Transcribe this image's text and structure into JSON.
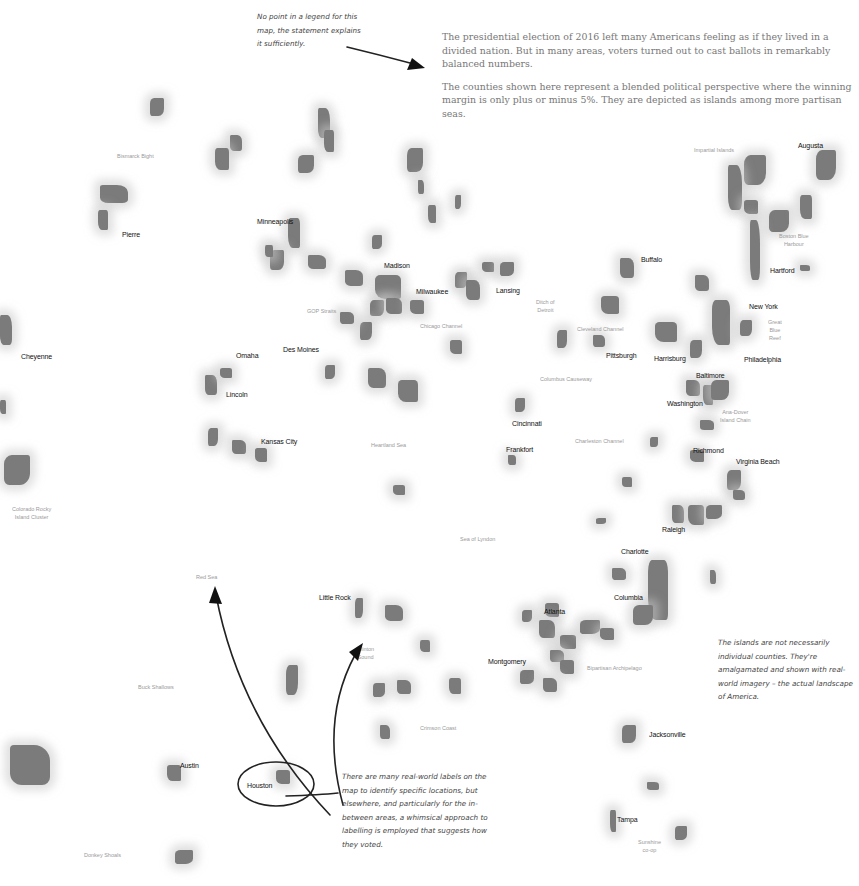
{
  "intro": {
    "paragraph1": "The presidential election of 2016 left many Americans feeling as if they lived in a divided nation. But in many areas, voters turned out to cast ballots in remarkably balanced numbers.",
    "paragraph2": "The counties shown here represent a blended political perspective where the winning margin is only plus or minus 5%. They are depicted as islands among more partisan seas."
  },
  "notes": {
    "legend_note": "No point in a legend for this map, the statement explains it sufficiently.",
    "islands_note": "The islands are not necessarily individual counties. They're amalgamated and shown with real-world imagery – the actual landscape of America.",
    "labels_note": "There are many real-world labels on the map to identify specific locations, but elsewhere, and particularly for the in-between areas, a whimsical approach to labelling is employed that suggests how they voted."
  },
  "cities": [
    {
      "name": "Augusta",
      "x": 798,
      "y": 142
    },
    {
      "name": "Pierre",
      "x": 122,
      "y": 231
    },
    {
      "name": "Minneapolis",
      "x": 257,
      "y": 218
    },
    {
      "name": "Madison",
      "x": 384,
      "y": 262
    },
    {
      "name": "Milwaukee",
      "x": 416,
      "y": 288
    },
    {
      "name": "Lansing",
      "x": 496,
      "y": 287
    },
    {
      "name": "Buffalo",
      "x": 641,
      "y": 256
    },
    {
      "name": "Hartford",
      "x": 770,
      "y": 267
    },
    {
      "name": "New York",
      "x": 749,
      "y": 303
    },
    {
      "name": "Cheyenne",
      "x": 21,
      "y": 353
    },
    {
      "name": "Omaha",
      "x": 236,
      "y": 352
    },
    {
      "name": "Des Moines",
      "x": 283,
      "y": 346
    },
    {
      "name": "Lincoln",
      "x": 226,
      "y": 391
    },
    {
      "name": "Pittsburgh",
      "x": 606,
      "y": 352
    },
    {
      "name": "Harrisburg",
      "x": 654,
      "y": 355
    },
    {
      "name": "Philadelphia",
      "x": 744,
      "y": 356
    },
    {
      "name": "Baltimore",
      "x": 696,
      "y": 372
    },
    {
      "name": "Washington",
      "x": 667,
      "y": 400
    },
    {
      "name": "Cincinnati",
      "x": 512,
      "y": 420
    },
    {
      "name": "Kansas City",
      "x": 261,
      "y": 438
    },
    {
      "name": "Frankfort",
      "x": 506,
      "y": 446
    },
    {
      "name": "Richmond",
      "x": 693,
      "y": 447
    },
    {
      "name": "Virginia Beach",
      "x": 736,
      "y": 458
    },
    {
      "name": "Raleigh",
      "x": 662,
      "y": 526
    },
    {
      "name": "Charlotte",
      "x": 621,
      "y": 548
    },
    {
      "name": "Little Rock",
      "x": 319,
      "y": 594
    },
    {
      "name": "Columbia",
      "x": 614,
      "y": 594
    },
    {
      "name": "Atlanta",
      "x": 544,
      "y": 608
    },
    {
      "name": "Montgomery",
      "x": 488,
      "y": 658
    },
    {
      "name": "Jacksonville",
      "x": 649,
      "y": 731
    },
    {
      "name": "Austin",
      "x": 180,
      "y": 762
    },
    {
      "name": "Houston",
      "x": 247,
      "y": 782
    },
    {
      "name": "Tampa",
      "x": 617,
      "y": 816
    }
  ],
  "seas": [
    {
      "name": "Bismarck Bight",
      "x": 117,
      "y": 152
    },
    {
      "name": "Impartial Islands",
      "x": 694,
      "y": 146
    },
    {
      "name": "Boston Blue\nHarbour",
      "x": 779,
      "y": 232
    },
    {
      "name": "GOP Straits",
      "x": 307,
      "y": 307
    },
    {
      "name": "Chicago Channel",
      "x": 420,
      "y": 322
    },
    {
      "name": "Ditch of\nDetroit",
      "x": 536,
      "y": 298
    },
    {
      "name": "Cleveland Channel",
      "x": 577,
      "y": 325
    },
    {
      "name": "Great\nBlue\nReef",
      "x": 768,
      "y": 318
    },
    {
      "name": "Columbus Causeway",
      "x": 540,
      "y": 375
    },
    {
      "name": "Ana-Dover\nIsland Chain",
      "x": 720,
      "y": 408
    },
    {
      "name": "Heartland Sea",
      "x": 371,
      "y": 441
    },
    {
      "name": "Charleston Channel",
      "x": 575,
      "y": 437
    },
    {
      "name": "Colorado Rocky\nIsland Cluster",
      "x": 12,
      "y": 505
    },
    {
      "name": "Sea of Lyndon",
      "x": 460,
      "y": 535
    },
    {
      "name": "Red Sea",
      "x": 196,
      "y": 573
    },
    {
      "name": "Clinton\nSound",
      "x": 357,
      "y": 645
    },
    {
      "name": "Bipartisan Archipelago",
      "x": 587,
      "y": 664
    },
    {
      "name": "Buck Shallows",
      "x": 138,
      "y": 683
    },
    {
      "name": "Crimson Coast",
      "x": 420,
      "y": 724
    },
    {
      "name": "Donkey Shoals",
      "x": 84,
      "y": 851
    },
    {
      "name": "Sunshine\nco-op",
      "x": 638,
      "y": 838
    }
  ],
  "islands": [
    [
      150,
      98,
      14,
      18
    ],
    [
      230,
      135,
      12,
      16
    ],
    [
      215,
      148,
      14,
      22
    ],
    [
      298,
      155,
      16,
      18
    ],
    [
      318,
      108,
      12,
      30
    ],
    [
      324,
      130,
      10,
      22
    ],
    [
      407,
      148,
      16,
      24
    ],
    [
      418,
      180,
      6,
      14
    ],
    [
      428,
      205,
      8,
      18
    ],
    [
      455,
      195,
      6,
      14
    ],
    [
      100,
      185,
      28,
      18
    ],
    [
      98,
      210,
      10,
      20
    ],
    [
      744,
      155,
      22,
      30
    ],
    [
      728,
      165,
      14,
      45
    ],
    [
      744,
      200,
      14,
      14
    ],
    [
      769,
      210,
      20,
      22
    ],
    [
      750,
      220,
      10,
      60
    ],
    [
      800,
      195,
      12,
      24
    ],
    [
      816,
      150,
      20,
      30
    ],
    [
      800,
      265,
      10,
      6
    ],
    [
      288,
      218,
      12,
      30
    ],
    [
      270,
      250,
      14,
      20
    ],
    [
      308,
      255,
      18,
      14
    ],
    [
      265,
      245,
      8,
      12
    ],
    [
      372,
      235,
      10,
      14
    ],
    [
      345,
      270,
      18,
      16
    ],
    [
      375,
      275,
      26,
      24
    ],
    [
      370,
      300,
      14,
      16
    ],
    [
      386,
      298,
      16,
      16
    ],
    [
      410,
      300,
      14,
      14
    ],
    [
      455,
      272,
      12,
      16
    ],
    [
      466,
      280,
      14,
      20
    ],
    [
      482,
      262,
      12,
      10
    ],
    [
      500,
      262,
      14,
      14
    ],
    [
      620,
      258,
      14,
      20
    ],
    [
      601,
      296,
      18,
      18
    ],
    [
      557,
      330,
      10,
      18
    ],
    [
      593,
      335,
      12,
      12
    ],
    [
      655,
      322,
      22,
      20
    ],
    [
      690,
      340,
      12,
      18
    ],
    [
      695,
      275,
      14,
      16
    ],
    [
      712,
      300,
      18,
      45
    ],
    [
      740,
      320,
      12,
      16
    ],
    [
      0,
      315,
      12,
      30
    ],
    [
      0,
      400,
      6,
      14
    ],
    [
      4,
      455,
      26,
      30
    ],
    [
      205,
      375,
      12,
      20
    ],
    [
      220,
      368,
      12,
      10
    ],
    [
      208,
      428,
      10,
      18
    ],
    [
      232,
      440,
      14,
      14
    ],
    [
      255,
      448,
      12,
      14
    ],
    [
      325,
      365,
      10,
      14
    ],
    [
      368,
      368,
      18,
      20
    ],
    [
      398,
      380,
      20,
      22
    ],
    [
      360,
      322,
      12,
      18
    ],
    [
      340,
      312,
      14,
      12
    ],
    [
      450,
      340,
      12,
      14
    ],
    [
      515,
      398,
      10,
      14
    ],
    [
      508,
      455,
      8,
      10
    ],
    [
      393,
      485,
      12,
      10
    ],
    [
      650,
      437,
      8,
      10
    ],
    [
      686,
      380,
      14,
      16
    ],
    [
      703,
      385,
      10,
      20
    ],
    [
      711,
      380,
      18,
      20
    ],
    [
      700,
      420,
      14,
      10
    ],
    [
      690,
      450,
      14,
      12
    ],
    [
      727,
      470,
      14,
      20
    ],
    [
      733,
      490,
      12,
      10
    ],
    [
      622,
      477,
      10,
      10
    ],
    [
      596,
      518,
      10,
      6
    ],
    [
      672,
      505,
      12,
      18
    ],
    [
      688,
      505,
      16,
      20
    ],
    [
      706,
      505,
      16,
      14
    ],
    [
      612,
      568,
      14,
      12
    ],
    [
      648,
      560,
      20,
      60
    ],
    [
      633,
      605,
      20,
      20
    ],
    [
      710,
      570,
      6,
      14
    ],
    [
      545,
      603,
      14,
      14
    ],
    [
      522,
      610,
      10,
      12
    ],
    [
      539,
      620,
      16,
      18
    ],
    [
      560,
      635,
      16,
      14
    ],
    [
      580,
      620,
      20,
      14
    ],
    [
      550,
      650,
      14,
      12
    ],
    [
      560,
      660,
      14,
      14
    ],
    [
      520,
      670,
      14,
      14
    ],
    [
      543,
      678,
      14,
      14
    ],
    [
      600,
      628,
      14,
      12
    ],
    [
      355,
      598,
      8,
      20
    ],
    [
      385,
      605,
      18,
      16
    ],
    [
      420,
      640,
      10,
      12
    ],
    [
      373,
      683,
      12,
      14
    ],
    [
      397,
      680,
      14,
      14
    ],
    [
      449,
      678,
      12,
      16
    ],
    [
      286,
      665,
      12,
      30
    ],
    [
      380,
      725,
      10,
      14
    ],
    [
      167,
      765,
      14,
      16
    ],
    [
      175,
      850,
      18,
      14
    ],
    [
      10,
      745,
      40,
      40
    ],
    [
      276,
      770,
      14,
      14
    ],
    [
      622,
      725,
      14,
      18
    ],
    [
      647,
      782,
      12,
      8
    ],
    [
      610,
      810,
      6,
      22
    ],
    [
      675,
      826,
      12,
      14
    ]
  ]
}
